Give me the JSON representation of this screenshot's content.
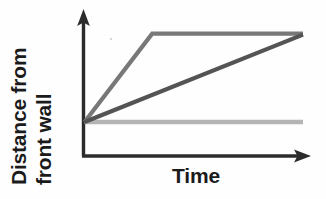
{
  "figure": {
    "background_color": "#fefefe",
    "y_axis_label_line1": "Distance from",
    "y_axis_label_line2": "front wall",
    "x_axis_label": "Time"
  },
  "chart_data": {
    "type": "line",
    "title": "",
    "xlabel": "Time",
    "ylabel": "Distance from front wall",
    "xlim": [
      0,
      1
    ],
    "ylim": [
      0,
      1
    ],
    "grid": false,
    "legend": "none",
    "axis_style": "arrow-headed axes, no tick marks, no numeric tick labels",
    "x_tick_labels": [],
    "y_tick_labels": [],
    "series": [
      {
        "name": "fast-then-stopped",
        "description": "Rises steeply from the origin, then levels off at a high constant distance",
        "color": "#787878",
        "linewidth": 4,
        "x": [
          0,
          0.31,
          1.0
        ],
        "y": [
          0,
          0.92,
          0.92
        ]
      },
      {
        "name": "steady-slow",
        "description": "Rises at a constant slower rate from the origin to the same final distance",
        "color": "#545454",
        "linewidth": 4,
        "x": [
          0,
          1.0
        ],
        "y": [
          0,
          0.91
        ]
      },
      {
        "name": "not-moving",
        "description": "Flat horizontal line at the starting distance",
        "color": "#b4b4b4",
        "linewidth": 4,
        "x": [
          0,
          1.0
        ],
        "y": [
          0,
          0
        ]
      }
    ],
    "colors": {
      "axis": "#2b2b2b",
      "fast_then_stopped": "#787878",
      "steady_slow": "#545454",
      "not_moving": "#b4b4b4",
      "text": "#1b1b1b"
    }
  }
}
